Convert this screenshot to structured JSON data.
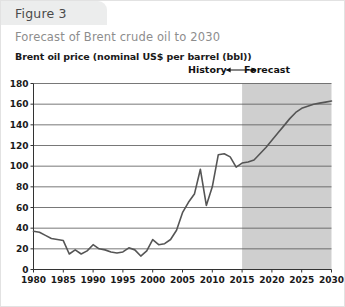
{
  "figure": {
    "tab_label": "Figure 3",
    "subtitle": "Forecast of Brent crude oil to 2030"
  },
  "annotations": {
    "history_label": "History",
    "forecast_label": "Forecast",
    "split_year": 2015
  },
  "colors": {
    "tab_background": "#eceded",
    "subtitle_text": "#8d8d8d",
    "tab_text": "#4a4a4a",
    "axis_text": "#1a1a1a",
    "line": "#555555",
    "gridline": "#555555",
    "forecast_shading": "#cfcfcf",
    "card_border": "#e2e2e2"
  },
  "chart_data": {
    "type": "line",
    "title": "Forecast of Brent crude oil to 2030",
    "ylabel": "Brent oil price (nominal US$ per barrel (bbl))",
    "xlabel": "",
    "xlim": [
      1980,
      2030
    ],
    "ylim": [
      0,
      180
    ],
    "ytick_step": 20,
    "xtick_step": 5,
    "grid": true,
    "legend": "none",
    "yticks": [
      0,
      20,
      40,
      60,
      80,
      100,
      120,
      140,
      160,
      180
    ],
    "xticks": [
      1980,
      1985,
      1990,
      1995,
      2000,
      2005,
      2010,
      2015,
      2020,
      2025,
      2030
    ],
    "ytick_labels": [
      "0",
      "20",
      "40",
      "60",
      "80",
      "100",
      "120",
      "140",
      "160",
      "180"
    ],
    "xtick_labels": [
      "1980",
      "1985",
      "1990",
      "1995",
      "2000",
      "2005",
      "2010",
      "2015",
      "2020",
      "2025",
      "2030"
    ],
    "series": [
      {
        "name": "Brent oil price (nominal US$ per bbl)",
        "x": [
          1980,
          1981,
          1982,
          1983,
          1984,
          1985,
          1986,
          1987,
          1988,
          1989,
          1990,
          1991,
          1992,
          1993,
          1994,
          1995,
          1996,
          1997,
          1998,
          1999,
          2000,
          2001,
          2002,
          2003,
          2004,
          2005,
          2006,
          2007,
          2008,
          2009,
          2010,
          2011,
          2012,
          2013,
          2014,
          2015,
          2016,
          2017,
          2018,
          2019,
          2020,
          2021,
          2022,
          2023,
          2024,
          2025,
          2026,
          2027,
          2028,
          2029,
          2030
        ],
        "values": [
          37,
          36,
          33,
          30,
          29,
          28,
          15,
          19,
          15,
          18,
          24,
          20,
          19,
          17,
          16,
          17,
          21,
          19,
          13,
          18,
          29,
          24,
          25,
          29,
          38,
          55,
          65,
          73,
          97,
          62,
          80,
          111,
          112,
          109,
          99,
          103,
          104,
          106,
          112,
          118,
          125,
          132,
          139,
          146,
          152,
          156,
          158,
          160,
          161,
          162,
          163
        ]
      }
    ],
    "shaded_region": {
      "label": "Forecast",
      "x_start": 2015,
      "x_end": 2030,
      "color": "#cfcfcf"
    }
  }
}
